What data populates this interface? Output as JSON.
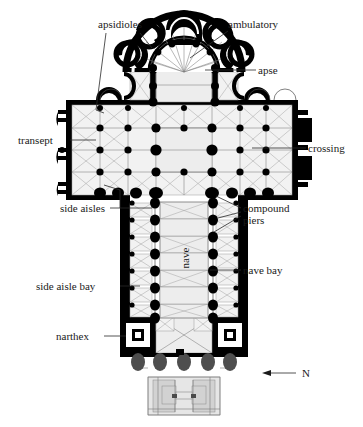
{
  "figure": {
    "kind": "architectural-floor-plan",
    "background_color": "#ffffff",
    "ink_color": "#000000"
  },
  "labels": {
    "apsidioles": "apsidioles",
    "ambulatory": "ambulatory",
    "apse": "apse",
    "transept": "transept",
    "crossing": "crossing",
    "side_aisles": "side aisles",
    "compound_piers_line1": "compound",
    "compound_piers_line2": "piers",
    "nave": "nave",
    "nave_bay": "nave bay",
    "side_aisle_bay": "side aisle bay",
    "narthex": "narthex",
    "north": "N"
  },
  "compass": {
    "letter": "N",
    "arrow_direction": "left"
  },
  "plan_parts": [
    {
      "name": "chevet",
      "description": "radiating chapels, ambulatory and apse at the top (east end)"
    },
    {
      "name": "choir",
      "description": "bays between apse and crossing"
    },
    {
      "name": "transept",
      "description": "wide cross-arms with eastern apsidal chapels"
    },
    {
      "name": "crossing",
      "description": "square bay where nave and transept intersect"
    },
    {
      "name": "nave",
      "description": "long central vessel running to the west end"
    },
    {
      "name": "side_aisles",
      "description": "narrow vaulted bays flanking the nave"
    },
    {
      "name": "narthex",
      "description": "entrance block with two tower bases at the west end"
    },
    {
      "name": "former_westwork",
      "description": "ghosted outline of earlier structure beyond the narthex"
    }
  ]
}
